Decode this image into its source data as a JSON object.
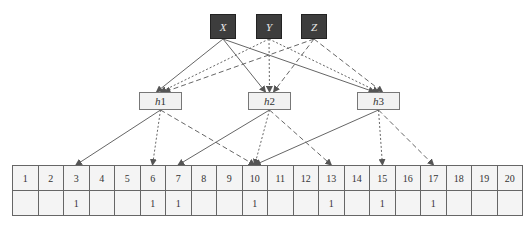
{
  "diagram": {
    "type": "bloom-filter",
    "inputs": [
      {
        "id": "X",
        "label": "X",
        "x": 210,
        "y": 14,
        "edge_style": "solid"
      },
      {
        "id": "Y",
        "label": "Y",
        "x": 256,
        "y": 14,
        "edge_style": "dotted"
      },
      {
        "id": "Z",
        "label": "Z",
        "x": 301,
        "y": 14,
        "edge_style": "dashed"
      }
    ],
    "hash_functions": [
      {
        "id": "h1",
        "label_var": "h",
        "label_num": "1",
        "x": 139,
        "y": 92
      },
      {
        "id": "h2",
        "label_var": "h",
        "label_num": "2",
        "x": 248,
        "y": 92
      },
      {
        "id": "h3",
        "label_var": "h",
        "label_num": "3",
        "x": 357,
        "y": 92
      }
    ],
    "hash_outputs": {
      "h1": {
        "solid": 3,
        "dotted": 6,
        "dashed": 10
      },
      "h2": {
        "solid": 7,
        "dotted": 10,
        "dashed": 13
      },
      "h3": {
        "solid": 10,
        "dotted": 15,
        "dashed": 17
      }
    },
    "bit_array": {
      "indices": [
        "1",
        "2",
        "3",
        "4",
        "5",
        "6",
        "7",
        "8",
        "9",
        "10",
        "11",
        "12",
        "13",
        "14",
        "15",
        "16",
        "17",
        "18",
        "19",
        "20"
      ],
      "values": [
        "",
        "",
        "1",
        "",
        "",
        "1",
        "1",
        "",
        "",
        "1",
        "",
        "",
        "1",
        "",
        "1",
        "",
        "1",
        "",
        "",
        ""
      ]
    },
    "colors": {
      "input_fill": "#3d3d3d",
      "hash_fill": "#f2f2f2",
      "edge": "#666666",
      "cell_fill": "#f4f4f4"
    }
  }
}
